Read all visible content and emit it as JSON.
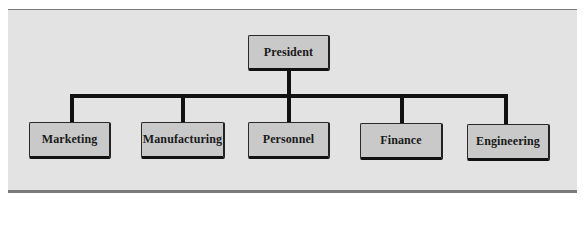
{
  "diagram": {
    "type": "org-chart",
    "root": {
      "label": "President"
    },
    "children": [
      {
        "label": "Marketing"
      },
      {
        "label": "Manufacturing"
      },
      {
        "label": "Personnel"
      },
      {
        "label": "Finance"
      },
      {
        "label": "Engineering"
      }
    ]
  },
  "colors": {
    "panel_background": "#e3e3e3",
    "node_fill": "#c9c9c9",
    "connector": "#111111",
    "rule": "#7a7a7a"
  }
}
